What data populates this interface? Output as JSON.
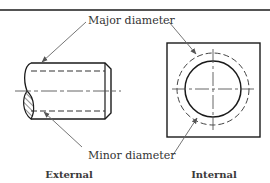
{
  "figure": {
    "labels": {
      "major_diameter": "Major diameter",
      "minor_diameter": "Minor diameter"
    },
    "captions": {
      "external": "External",
      "internal": "Internal"
    },
    "colors": {
      "line": "#1a1a1a",
      "leader": "#666666",
      "text": "#333333",
      "background": "#ffffff"
    }
  }
}
